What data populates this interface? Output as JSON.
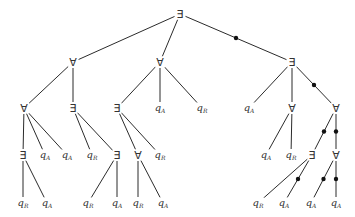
{
  "diagram": {
    "type": "game-tree",
    "symbols": {
      "exists": "∃",
      "forall": "∀",
      "q": "q"
    },
    "nodes": [
      {
        "id": "n0",
        "label": "∃",
        "kind": "quant",
        "x": 180,
        "y": 14
      },
      {
        "id": "n1",
        "label": "∀",
        "kind": "quant",
        "x": 73,
        "y": 62
      },
      {
        "id": "n2",
        "label": "∀",
        "kind": "quant",
        "x": 160,
        "y": 62
      },
      {
        "id": "n3",
        "label": "∃",
        "kind": "quant",
        "x": 292,
        "y": 62
      },
      {
        "id": "n4",
        "label": "∀",
        "kind": "quant",
        "x": 24,
        "y": 108
      },
      {
        "id": "n5",
        "label": "∃",
        "kind": "quant",
        "x": 73,
        "y": 108
      },
      {
        "id": "n6",
        "label": "∃",
        "kind": "quant",
        "x": 117,
        "y": 108
      },
      {
        "id": "n7",
        "label": "q",
        "sub": "A",
        "kind": "leaf",
        "x": 160,
        "y": 108
      },
      {
        "id": "n8",
        "label": "q",
        "sub": "R",
        "kind": "leaf",
        "x": 202,
        "y": 108
      },
      {
        "id": "n9",
        "label": "q",
        "sub": "A",
        "kind": "leaf",
        "x": 249,
        "y": 108
      },
      {
        "id": "n10",
        "label": "∀",
        "kind": "quant",
        "x": 292,
        "y": 108
      },
      {
        "id": "n11",
        "label": "∀",
        "kind": "quant",
        "x": 336,
        "y": 108
      },
      {
        "id": "n12",
        "label": "∃",
        "kind": "quant",
        "x": 23,
        "y": 155
      },
      {
        "id": "n13",
        "label": "q",
        "sub": "A",
        "kind": "leaf",
        "x": 45,
        "y": 155
      },
      {
        "id": "n14",
        "label": "q",
        "sub": "A",
        "kind": "leaf",
        "x": 67,
        "y": 155
      },
      {
        "id": "n15",
        "label": "q",
        "sub": "R",
        "kind": "leaf",
        "x": 92,
        "y": 155
      },
      {
        "id": "n16",
        "label": "∃",
        "kind": "quant",
        "x": 117,
        "y": 155
      },
      {
        "id": "n17",
        "label": "∀",
        "kind": "quant",
        "x": 138,
        "y": 155
      },
      {
        "id": "n18",
        "label": "q",
        "sub": "R",
        "kind": "leaf",
        "x": 160,
        "y": 155
      },
      {
        "id": "n19",
        "label": "q",
        "sub": "A",
        "kind": "leaf",
        "x": 266,
        "y": 155
      },
      {
        "id": "n20",
        "label": "q",
        "sub": "R",
        "kind": "leaf",
        "x": 291,
        "y": 155
      },
      {
        "id": "n21",
        "label": "∃",
        "kind": "quant",
        "x": 312,
        "y": 155
      },
      {
        "id": "n22",
        "label": "∀",
        "kind": "quant",
        "x": 336,
        "y": 155
      },
      {
        "id": "n23",
        "label": "q",
        "sub": "R",
        "kind": "leaf",
        "x": 23,
        "y": 203
      },
      {
        "id": "n24",
        "label": "q",
        "sub": "A",
        "kind": "leaf",
        "x": 47,
        "y": 203
      },
      {
        "id": "n25",
        "label": "q",
        "sub": "R",
        "kind": "leaf",
        "x": 88,
        "y": 203
      },
      {
        "id": "n26",
        "label": "q",
        "sub": "A",
        "kind": "leaf",
        "x": 117,
        "y": 203
      },
      {
        "id": "n27",
        "label": "q",
        "sub": "R",
        "kind": "leaf",
        "x": 138,
        "y": 203
      },
      {
        "id": "n28",
        "label": "q",
        "sub": "A",
        "kind": "leaf",
        "x": 163,
        "y": 203
      },
      {
        "id": "n29",
        "label": "q",
        "sub": "R",
        "kind": "leaf",
        "x": 258,
        "y": 203
      },
      {
        "id": "n30",
        "label": "q",
        "sub": "A",
        "kind": "leaf",
        "x": 284,
        "y": 203
      },
      {
        "id": "n31",
        "label": "q",
        "sub": "A",
        "kind": "leaf",
        "x": 311,
        "y": 203
      },
      {
        "id": "n32",
        "label": "q",
        "sub": "A",
        "kind": "leaf",
        "x": 336,
        "y": 203
      }
    ],
    "edges": [
      {
        "from": "n0",
        "to": "n1",
        "marked": false
      },
      {
        "from": "n0",
        "to": "n2",
        "marked": false
      },
      {
        "from": "n0",
        "to": "n3",
        "marked": true
      },
      {
        "from": "n1",
        "to": "n4",
        "marked": false
      },
      {
        "from": "n1",
        "to": "n5",
        "marked": false
      },
      {
        "from": "n2",
        "to": "n6",
        "marked": false
      },
      {
        "from": "n2",
        "to": "n7",
        "marked": false
      },
      {
        "from": "n2",
        "to": "n8",
        "marked": false
      },
      {
        "from": "n3",
        "to": "n9",
        "marked": false
      },
      {
        "from": "n3",
        "to": "n10",
        "marked": false
      },
      {
        "from": "n3",
        "to": "n11",
        "marked": true
      },
      {
        "from": "n4",
        "to": "n12",
        "marked": false
      },
      {
        "from": "n4",
        "to": "n13",
        "marked": false
      },
      {
        "from": "n4",
        "to": "n14",
        "marked": false
      },
      {
        "from": "n5",
        "to": "n15",
        "marked": false
      },
      {
        "from": "n5",
        "to": "n16",
        "marked": false
      },
      {
        "from": "n6",
        "to": "n17",
        "marked": false
      },
      {
        "from": "n6",
        "to": "n18",
        "marked": false
      },
      {
        "from": "n10",
        "to": "n19",
        "marked": false
      },
      {
        "from": "n10",
        "to": "n20",
        "marked": false
      },
      {
        "from": "n11",
        "to": "n21",
        "marked": true
      },
      {
        "from": "n11",
        "to": "n22",
        "marked": true
      },
      {
        "from": "n12",
        "to": "n23",
        "marked": false
      },
      {
        "from": "n12",
        "to": "n24",
        "marked": false
      },
      {
        "from": "n16",
        "to": "n25",
        "marked": false
      },
      {
        "from": "n16",
        "to": "n26",
        "marked": false
      },
      {
        "from": "n17",
        "to": "n27",
        "marked": false
      },
      {
        "from": "n17",
        "to": "n28",
        "marked": false
      },
      {
        "from": "n21",
        "to": "n29",
        "marked": false
      },
      {
        "from": "n21",
        "to": "n30",
        "marked": true
      },
      {
        "from": "n22",
        "to": "n31",
        "marked": true
      },
      {
        "from": "n22",
        "to": "n32",
        "marked": true
      }
    ],
    "colors": {
      "edge": "#2b2b2b",
      "dot": "#111111",
      "label": "#333333",
      "background": "#ffffff"
    }
  }
}
